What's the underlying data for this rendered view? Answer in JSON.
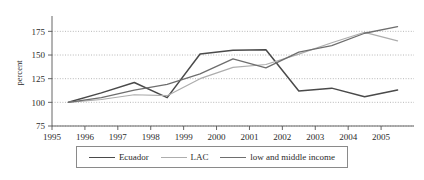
{
  "chart_data": {
    "type": "line",
    "title": "",
    "xlabel": "",
    "ylabel": "percent",
    "xlim": [
      1995,
      2006
    ],
    "ylim": [
      75,
      187
    ],
    "grid": true,
    "legend_position": "bottom",
    "x_tick_labels": [
      "1995",
      "1996",
      "1997",
      "1998",
      "1999",
      "2000",
      "2001",
      "2002",
      "2003",
      "2004",
      "2005"
    ],
    "x_ticks": [
      1995,
      1996,
      1997,
      1998,
      1999,
      2000,
      2001,
      2002,
      2003,
      2004,
      2005
    ],
    "y_tick_labels": [
      "75",
      "100",
      "125",
      "150",
      "175"
    ],
    "y_ticks": [
      75,
      100,
      125,
      150,
      175
    ],
    "x": [
      1995.5,
      1996.5,
      1997.5,
      1998.5,
      1999.5,
      2000.5,
      2001.5,
      2002.5,
      2003.5,
      2004.5,
      2005.5
    ],
    "series": [
      {
        "name": "Ecuador",
        "color": "#4a4a4a",
        "width": 1.5,
        "values": [
          100,
          110,
          121,
          105,
          151,
          155,
          155.5,
          112,
          115,
          106,
          113
        ]
      },
      {
        "name": "LAC",
        "color": "#adadad",
        "width": 1.2,
        "values": [
          100,
          103,
          108,
          107,
          125,
          137,
          140,
          151,
          163,
          174,
          165
        ]
      },
      {
        "name": "low and middle income",
        "color": "#6e6e6e",
        "width": 1.3,
        "values": [
          100,
          105,
          113,
          119,
          130,
          146,
          136.5,
          153,
          160,
          173,
          180
        ]
      }
    ]
  },
  "legend": {
    "entries": [
      {
        "label": "Ecuador"
      },
      {
        "label": "LAC"
      },
      {
        "label": "low and middle income"
      }
    ]
  }
}
